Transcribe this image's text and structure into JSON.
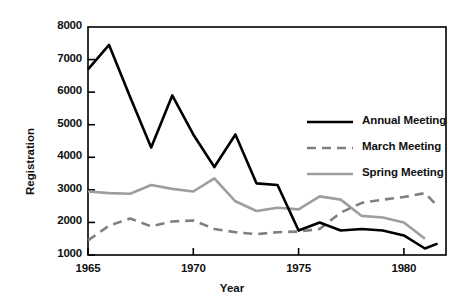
{
  "chart_data": {
    "type": "line",
    "title": "",
    "xlabel": "Year",
    "ylabel": "Registration",
    "xlim": [
      1965,
      1982
    ],
    "ylim": [
      1000,
      8000
    ],
    "xticks": [
      1965,
      1970,
      1975,
      1980
    ],
    "yticks": [
      1000,
      2000,
      3000,
      4000,
      5000,
      6000,
      7000,
      8000
    ],
    "xtick_labels": [
      "1965",
      "1970",
      "1975",
      "1980"
    ],
    "ytick_labels": [
      "1000",
      "2000",
      "3000",
      "4000",
      "5000",
      "6000",
      "7000",
      "8000"
    ],
    "grid": false,
    "legend_position": "upper right inside axes",
    "series": [
      {
        "name": "Annual Meeting",
        "style": "solid",
        "color": "#000000",
        "width": 2.6,
        "x": [
          1965,
          1966,
          1967,
          1968,
          1969,
          1970,
          1971,
          1972,
          1973,
          1974,
          1975,
          1976,
          1977,
          1978,
          1979,
          1980,
          1981,
          1981.6
        ],
        "values": [
          6700,
          7450,
          5850,
          4300,
          5900,
          4700,
          3700,
          4700,
          3200,
          3150,
          1750,
          2000,
          1750,
          1800,
          1750,
          1600,
          1200,
          1350
        ]
      },
      {
        "name": "March Meeting",
        "style": "dashed",
        "color": "#7f7f7f",
        "width": 2.6,
        "x": [
          1965,
          1966,
          1967,
          1968,
          1969,
          1970,
          1971,
          1972,
          1973,
          1974,
          1975,
          1976,
          1977,
          1978,
          1979,
          1980,
          1981,
          1981.6
        ],
        "values": [
          1450,
          1900,
          2120,
          1880,
          2030,
          2060,
          1800,
          1700,
          1640,
          1700,
          1720,
          1800,
          2300,
          2600,
          2700,
          2780,
          2900,
          2500
        ]
      },
      {
        "name": "Spring Meeting",
        "style": "solid",
        "color": "#9e9e9e",
        "width": 2.6,
        "x": [
          1965,
          1966,
          1967,
          1968,
          1969,
          1970,
          1971,
          1972,
          1973,
          1974,
          1975,
          1976,
          1977,
          1978,
          1979,
          1980,
          1981
        ],
        "values": [
          2950,
          2900,
          2880,
          3150,
          3030,
          2950,
          3350,
          2650,
          2350,
          2450,
          2400,
          2800,
          2700,
          2200,
          2150,
          2000,
          1500
        ]
      }
    ]
  },
  "legend": {
    "items": [
      {
        "label": "Annual Meeting"
      },
      {
        "label": "March Meeting"
      },
      {
        "label": "Spring Meeting"
      }
    ]
  },
  "axes": {
    "x_title": "Year",
    "y_title": "Registration"
  }
}
